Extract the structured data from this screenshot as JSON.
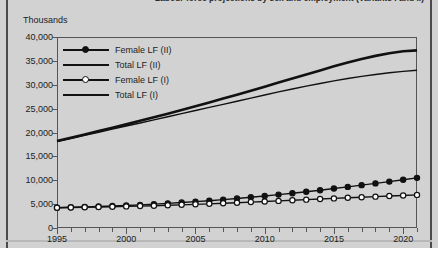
{
  "page": {
    "units_label": "Thousands",
    "title_fragment": "Labour force projections by sex and employment (Variants I and II)"
  },
  "chart_data": {
    "type": "line",
    "title": "",
    "xlabel": "",
    "ylabel": "Thousands",
    "xlim": [
      1995,
      2021
    ],
    "ylim": [
      0,
      40000
    ],
    "grid": false,
    "legend_position": "top-left",
    "y_ticks": [
      0,
      5000,
      10000,
      15000,
      20000,
      25000,
      30000,
      35000,
      40000
    ],
    "y_tick_labels": [
      "0",
      "5,000",
      "10,000",
      "15,000",
      "20,000",
      "25,000",
      "30,000",
      "35,000",
      "40,000"
    ],
    "x_ticks": [
      1995,
      2000,
      2005,
      2010,
      2015,
      2020
    ],
    "x_tick_labels": [
      "1995",
      "2000",
      "2005",
      "2010",
      "2015",
      "2020"
    ],
    "x_minor_ticks": [
      1996,
      1997,
      1998,
      1999,
      2001,
      2002,
      2003,
      2004,
      2006,
      2007,
      2008,
      2009,
      2011,
      2012,
      2013,
      2014,
      2016,
      2017,
      2018,
      2019,
      2021
    ],
    "x": [
      1995,
      1996,
      1997,
      1998,
      1999,
      2000,
      2001,
      2002,
      2003,
      2004,
      2005,
      2006,
      2007,
      2008,
      2009,
      2010,
      2011,
      2012,
      2013,
      2014,
      2015,
      2016,
      2017,
      2018,
      2019,
      2020,
      2021
    ],
    "series": [
      {
        "name": "Female LF (II)",
        "marker": "filled-circle",
        "line_width": 1.4,
        "color": "#111111",
        "values": [
          4250,
          4330,
          4420,
          4510,
          4610,
          4720,
          4850,
          5000,
          5160,
          5330,
          5520,
          5720,
          5940,
          6180,
          6430,
          6700,
          6990,
          7290,
          7600,
          7920,
          8260,
          8610,
          8970,
          9340,
          9720,
          10110,
          10500
        ]
      },
      {
        "name": "Total LF (II)",
        "marker": "none",
        "line_width": 2.6,
        "color": "#111111",
        "values": [
          18200,
          18900,
          19600,
          20300,
          21000,
          21700,
          22450,
          23200,
          23950,
          24700,
          25500,
          26300,
          27100,
          27900,
          28750,
          29600,
          30450,
          31300,
          32150,
          33000,
          33850,
          34650,
          35400,
          36050,
          36600,
          37000,
          37200
        ]
      },
      {
        "name": "Female LF (I)",
        "marker": "hollow-circle",
        "line_width": 1.4,
        "color": "#111111",
        "values": [
          4250,
          4300,
          4350,
          4400,
          4460,
          4520,
          4590,
          4670,
          4760,
          4850,
          4950,
          5060,
          5180,
          5300,
          5420,
          5550,
          5680,
          5810,
          5940,
          6070,
          6200,
          6330,
          6450,
          6570,
          6690,
          6810,
          6930
        ]
      },
      {
        "name": "Total LF (I)",
        "marker": "none",
        "line_width": 1.4,
        "color": "#111111",
        "values": [
          18100,
          18750,
          19400,
          20050,
          20700,
          21350,
          22000,
          22650,
          23300,
          23950,
          24600,
          25250,
          25900,
          26550,
          27200,
          27850,
          28500,
          29100,
          29700,
          30250,
          30800,
          31300,
          31750,
          32150,
          32500,
          32800,
          33050
        ]
      }
    ]
  },
  "legend": {
    "items": [
      {
        "label": "Female LF (II)",
        "marker": "filled-circle",
        "thick": false
      },
      {
        "label": "Total LF (II)",
        "marker": "none",
        "thick": true
      },
      {
        "label": "Female LF (I)",
        "marker": "hollow-circle",
        "thick": false
      },
      {
        "label": "Total LF (I)",
        "marker": "none",
        "thick": false
      }
    ]
  },
  "colors": {
    "page_background": "#d2d2d2",
    "ink": "#111111",
    "axis": "#555555",
    "rule": "#4a4a4a"
  }
}
